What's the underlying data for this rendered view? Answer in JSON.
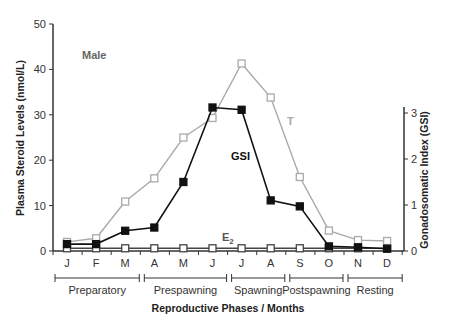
{
  "chart_data": {
    "type": "line",
    "title": "",
    "annotations": {
      "panel": "Male",
      "t_label": "T",
      "gsi_label": "GSI",
      "e2_label": "E",
      "e2_sub": "2"
    },
    "xlabel": "Reproductive Phases / Months",
    "ylabel": "Plasma Steroid Levels (nmol/L)",
    "y2label": "Gonadosomatic Index (GSI)",
    "categories": [
      "J",
      "F",
      "M",
      "A",
      "M",
      "J",
      "J",
      "A",
      "S",
      "O",
      "N",
      "D"
    ],
    "ylim": [
      0,
      50
    ],
    "yticks": [
      0,
      10,
      20,
      30,
      40,
      50
    ],
    "y2lim": [
      0,
      3.2
    ],
    "y2ticks": [
      0,
      1,
      2,
      3
    ],
    "grid": false,
    "legend": "inline labels",
    "series": [
      {
        "name": "T",
        "axis": "left",
        "marker": "open-square",
        "color": "#aaaaaa",
        "values": [
          2.0,
          2.8,
          10.9,
          16.0,
          25.0,
          29.3,
          41.3,
          33.8,
          16.3,
          4.5,
          2.4,
          2.2
        ]
      },
      {
        "name": "GSI",
        "axis": "right",
        "marker": "filled-square",
        "color": "#111111",
        "values": [
          0.15,
          0.15,
          0.44,
          0.51,
          1.5,
          3.12,
          3.07,
          1.1,
          0.97,
          0.1,
          0.08,
          0.05
        ]
      },
      {
        "name": "E2",
        "axis": "left",
        "marker": "open-square",
        "color": "#444444",
        "values": [
          0.6,
          0.6,
          0.6,
          0.6,
          0.6,
          0.6,
          0.6,
          0.6,
          0.6,
          0.6,
          0.6,
          0.6
        ]
      }
    ],
    "phases": [
      {
        "label": "Preparatory",
        "months": [
          "J",
          "F",
          "M"
        ]
      },
      {
        "label": "Prespawning",
        "months": [
          "A",
          "M",
          "J"
        ]
      },
      {
        "label": "Spawning",
        "months": [
          "J",
          "A"
        ]
      },
      {
        "label": "Postspawning",
        "months": [
          "S",
          "O"
        ]
      },
      {
        "label": "Resting",
        "months": [
          "N",
          "D"
        ]
      }
    ]
  }
}
